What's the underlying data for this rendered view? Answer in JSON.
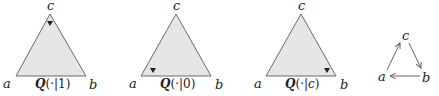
{
  "colors": {
    "triangle_fill": "#e6e6e6",
    "triangle_stroke": "#6a6a6a",
    "text": "#222222"
  },
  "simplices": [
    {
      "vertex_labels": {
        "a": "a",
        "b": "b",
        "c": "c"
      },
      "caption": {
        "Q": "Q",
        "open": "(·|",
        "arg": "1",
        "close": ")"
      },
      "marker_position": "near vertex c"
    },
    {
      "vertex_labels": {
        "a": "a",
        "b": "b",
        "c": "c"
      },
      "caption": {
        "Q": "Q",
        "open": "(·|",
        "arg": "0",
        "close": ")"
      },
      "marker_position": "near vertex a"
    },
    {
      "vertex_labels": {
        "a": "a",
        "b": "b",
        "c": "c"
      },
      "caption": {
        "Q": "Q",
        "open": "(·|",
        "arg": "c",
        "close": ")"
      },
      "marker_position": "near vertex b"
    }
  ],
  "cycle_graph": {
    "nodes": {
      "a": "a",
      "b": "b",
      "c": "c"
    },
    "edges": [
      {
        "from": "a",
        "to": "c"
      },
      {
        "from": "c",
        "to": "b"
      },
      {
        "from": "b",
        "to": "a"
      }
    ]
  }
}
